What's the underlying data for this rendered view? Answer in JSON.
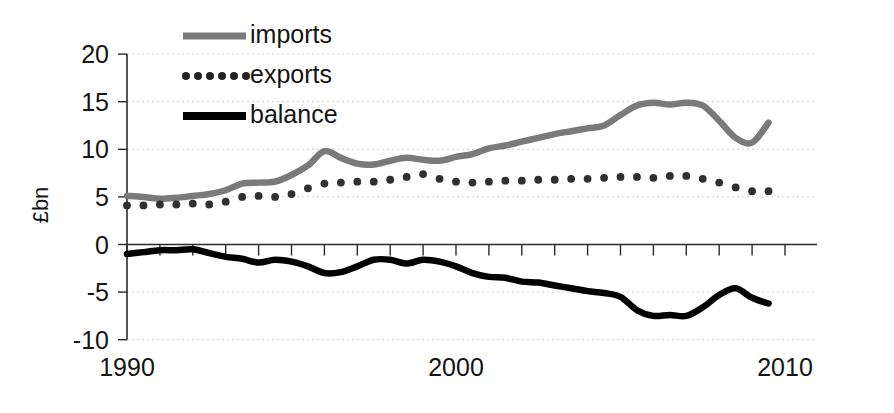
{
  "chart_data": {
    "type": "line",
    "title": "",
    "subtitle": "",
    "xlabel": "",
    "ylabel": "£bn",
    "xlim": [
      1990,
      2010
    ],
    "ylim": [
      -10,
      20
    ],
    "grid": true,
    "legend_position": "top-left",
    "y_ticks": [
      20,
      15,
      10,
      5,
      0,
      -5,
      -10
    ],
    "y_tick_labels": [
      "20",
      "15",
      "10",
      "5",
      "0",
      "-5",
      "-10"
    ],
    "x_ticks": [
      1990,
      1991,
      1992,
      1993,
      1994,
      1995,
      1996,
      1997,
      1998,
      1999,
      2000,
      2001,
      2002,
      2003,
      2004,
      2005,
      2006,
      2007,
      2008,
      2009,
      2010
    ],
    "x_tick_labels_shown": [
      "1990",
      "2000",
      "2010"
    ],
    "x_tick_labels_shown_at": [
      1990,
      2000,
      2010
    ],
    "x": [
      1990,
      1990.5,
      1991,
      1991.5,
      1992,
      1992.5,
      1993,
      1993.5,
      1994,
      1994.5,
      1995,
      1995.5,
      1996,
      1996.5,
      1997,
      1997.5,
      1998,
      1998.5,
      1999,
      1999.5,
      2000,
      2000.5,
      2001,
      2001.5,
      2002,
      2002.5,
      2003,
      2003.5,
      2004,
      2004.5,
      2005,
      2005.5,
      2006,
      2006.5,
      2007,
      2007.5,
      2008,
      2008.5,
      2009,
      2009.5
    ],
    "series": [
      {
        "name": "imports",
        "color": "#7a7a7a",
        "style": "solid-thick",
        "values": [
          5.1,
          5.0,
          4.8,
          4.9,
          5.1,
          5.3,
          5.7,
          6.4,
          6.5,
          6.6,
          7.3,
          8.3,
          9.8,
          9.1,
          8.5,
          8.4,
          8.8,
          9.1,
          8.9,
          8.8,
          9.2,
          9.5,
          10.1,
          10.4,
          10.8,
          11.2,
          11.6,
          11.9,
          12.2,
          12.5,
          13.6,
          14.6,
          14.9,
          14.7,
          14.9,
          14.6,
          13.0,
          11.2,
          10.7,
          12.8
        ]
      },
      {
        "name": "exports",
        "color": "#303030",
        "style": "dotted",
        "values": [
          4.1,
          4.1,
          4.2,
          4.2,
          4.3,
          4.2,
          4.5,
          5.0,
          5.1,
          5.0,
          5.3,
          5.9,
          6.4,
          6.5,
          6.6,
          6.6,
          6.8,
          7.1,
          7.4,
          6.9,
          6.6,
          6.5,
          6.6,
          6.7,
          6.7,
          6.8,
          6.8,
          6.9,
          6.9,
          7.0,
          7.1,
          7.1,
          7.0,
          7.2,
          7.2,
          6.9,
          6.5,
          6.0,
          5.6,
          5.6
        ]
      },
      {
        "name": "balance",
        "color": "#000000",
        "style": "solid-thick",
        "values": [
          -1.0,
          -0.8,
          -0.6,
          -0.6,
          -0.5,
          -0.9,
          -1.3,
          -1.5,
          -1.9,
          -1.6,
          -1.8,
          -2.3,
          -3.0,
          -2.9,
          -2.3,
          -1.6,
          -1.6,
          -2.0,
          -1.6,
          -1.8,
          -2.3,
          -3.0,
          -3.4,
          -3.5,
          -3.9,
          -4.0,
          -4.3,
          -4.6,
          -4.9,
          -5.1,
          -5.5,
          -6.9,
          -7.5,
          -7.4,
          -7.5,
          -6.6,
          -5.3,
          -4.6,
          -5.6,
          -6.2
        ]
      }
    ],
    "legend": [
      {
        "label": "imports",
        "marker": "solid-line",
        "color": "#7a7a7a"
      },
      {
        "label": "exports",
        "marker": "dotted-line",
        "color": "#303030"
      },
      {
        "label": "balance",
        "marker": "solid-line",
        "color": "#000000"
      }
    ]
  }
}
